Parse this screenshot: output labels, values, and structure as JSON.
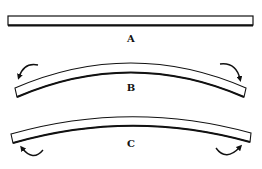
{
  "diagram": {
    "beams": [
      {
        "id": "A",
        "label": "A",
        "shape": "straight",
        "moments": "none"
      },
      {
        "id": "B",
        "label": "B",
        "shape": "arched-up",
        "moments": "ends-rotating-downward-outward"
      },
      {
        "id": "C",
        "label": "C",
        "shape": "arched-up",
        "moments": "ends-rotating-upward-from-below"
      }
    ],
    "colors": {
      "stroke": "#111111",
      "fill": "#ffffff"
    }
  }
}
